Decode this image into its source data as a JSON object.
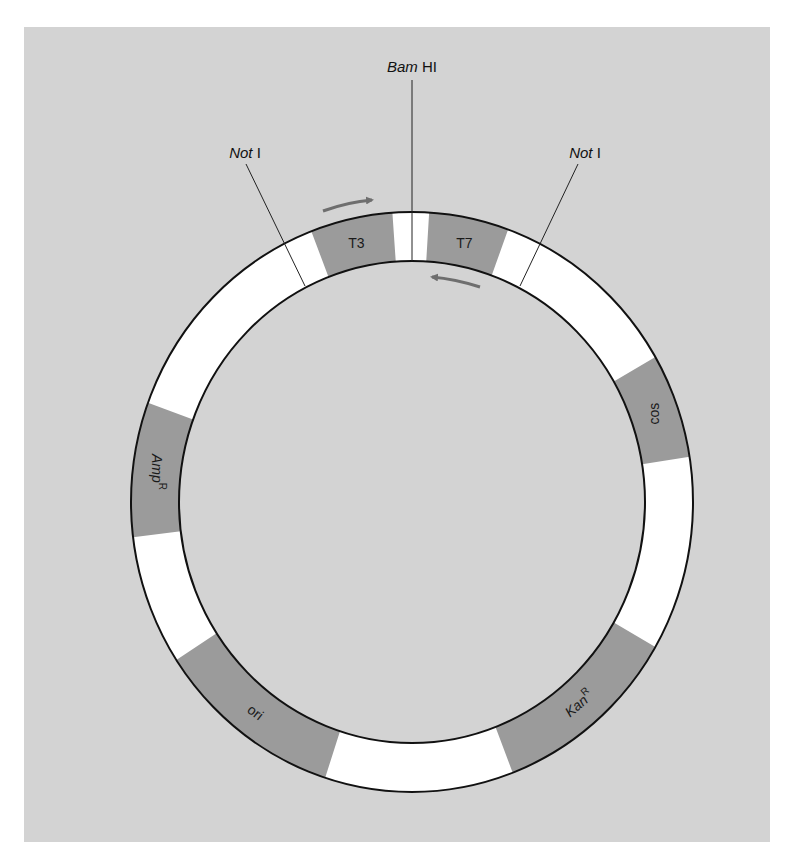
{
  "diagram": {
    "type": "plasmid-map",
    "colors": {
      "background": "#d3d3d3",
      "ring": "#ffffff",
      "segment": "#9b9b9b",
      "outline": "#111111",
      "arrow": "#6e6e6e"
    },
    "restriction_sites": [
      {
        "name_italic": "Bam",
        "name_roman": " HI",
        "angle_deg": 0
      },
      {
        "name_italic": "Not",
        "name_roman": " I",
        "position": "left"
      },
      {
        "name_italic": "Not",
        "name_roman": " I",
        "position": "right"
      }
    ],
    "segments": [
      {
        "label": "T3",
        "start_deg": 339,
        "end_deg": 356
      },
      {
        "label": "T7",
        "start_deg": 3.5,
        "end_deg": 20
      },
      {
        "label": "cos",
        "start_deg": 60,
        "end_deg": 81
      },
      {
        "label": "Kan",
        "superscript": "R",
        "start_deg": 120,
        "end_deg": 159
      },
      {
        "label": "ori",
        "start_deg": 198,
        "end_deg": 237
      },
      {
        "label": "Amp",
        "superscript": "R",
        "start_deg": 263,
        "end_deg": 290
      }
    ],
    "promoter_arrows": [
      {
        "name": "T3 promoter",
        "direction": "clockwise"
      },
      {
        "name": "T7 promoter",
        "direction": "counterclockwise"
      }
    ]
  }
}
